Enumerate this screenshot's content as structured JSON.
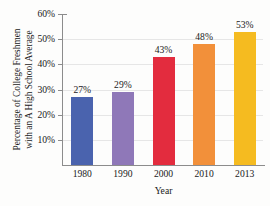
{
  "chart_data": {
    "type": "bar",
    "title": "",
    "categories": [
      "1980",
      "1990",
      "2000",
      "2010",
      "2013"
    ],
    "values": [
      27,
      29,
      43,
      48,
      53
    ],
    "value_labels": [
      "27%",
      "29%",
      "43%",
      "48%",
      "53%"
    ],
    "xlabel": "Year",
    "ylabel_line1": "Percentage of College Freshmen",
    "ylabel_line2": "with an A High School Average",
    "ylim": [
      0,
      60
    ],
    "ytick_labels": [
      "10%",
      "20%",
      "30%",
      "40%",
      "50%",
      "60%"
    ],
    "ytick_values": [
      10,
      20,
      30,
      40,
      50,
      60
    ],
    "grid": true,
    "legend": "none",
    "bar_colors": [
      "#4a63ae",
      "#8f78b8",
      "#e32c3e",
      "#f2903a",
      "#f5bb20"
    ]
  },
  "figure": {
    "background": "#fdfdfc",
    "axis_color": "#8c8c8c",
    "grid_color": "#e6e6e6",
    "text_color": "#1a1a1a",
    "cropped_title_fragment": ""
  }
}
